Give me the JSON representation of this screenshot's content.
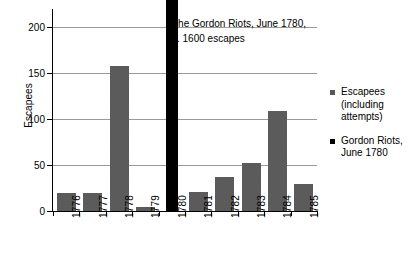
{
  "chart_data": {
    "type": "bar",
    "title": "",
    "subtitle": "",
    "xlabel": "",
    "ylabel": "Escapees",
    "ylim": [
      0,
      220
    ],
    "yticks": [
      0,
      50,
      100,
      150,
      200
    ],
    "ytick_labels": [
      "0",
      "50",
      "100",
      "150",
      "200"
    ],
    "grid": true,
    "grid_axis": "y",
    "legend_position": "right",
    "categories": [
      "1776",
      "1777",
      "1778",
      "1779",
      "1780",
      "1781",
      "1782",
      "1783",
      "1784",
      "1785"
    ],
    "series": [
      {
        "name": "Escapees (including attempts)",
        "color": "#575757",
        "values": [
          20,
          20,
          158,
          4,
          null,
          21,
          37,
          52,
          109,
          29
        ]
      },
      {
        "name": "Gordon Riots, June 1780",
        "color": "#000000",
        "values": [
          null,
          null,
          null,
          null,
          1600,
          null,
          null,
          null,
          null,
          null
        ],
        "clipped": true,
        "clipped_note": "bar exceeds the plotted axis range and is drawn truncated at the top of the plot"
      }
    ],
    "annotations": [
      {
        "name": "gordon-riots-annotation",
        "lines": [
          "The Gordon Riots, June 1780,",
          "c. 1600 escapes"
        ]
      }
    ]
  },
  "axes": {
    "y_title": "Escapees",
    "y_ticks": [
      {
        "label": "200",
        "value": 200
      },
      {
        "label": "150",
        "value": 150
      },
      {
        "label": "100",
        "value": 100
      },
      {
        "label": "50",
        "value": 50
      },
      {
        "label": "0",
        "value": 0
      }
    ],
    "x_ticks": [
      {
        "label": "1776"
      },
      {
        "label": "1777"
      },
      {
        "label": "1778"
      },
      {
        "label": "1779"
      },
      {
        "label": "1780"
      },
      {
        "label": "1781"
      },
      {
        "label": "1782"
      },
      {
        "label": "1783"
      },
      {
        "label": "1784"
      },
      {
        "label": "1785"
      }
    ]
  },
  "annotation": {
    "line1": "The Gordon Riots, June 1780,",
    "line2": "c. 1600 escapes"
  },
  "legend": {
    "items": [
      {
        "label": "Escapees (including attempts)",
        "swatch": "escapee",
        "color": "#575757"
      },
      {
        "label": "Gordon Riots, June 1780",
        "swatch": "riot",
        "color": "#000000"
      }
    ]
  },
  "colors": {
    "escapee_bar": "#575757",
    "riot_bar": "#000000",
    "gridline": "#9a9a9a",
    "axis": "#000000",
    "background": "#ffffff"
  }
}
